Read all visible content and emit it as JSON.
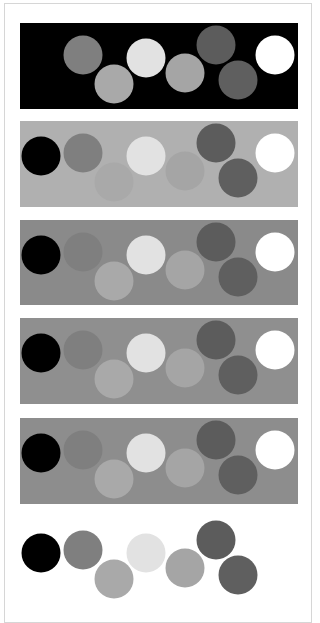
{
  "figure": {
    "circle_radius": 19.5,
    "circles": [
      {
        "id": "black",
        "color": "#000000",
        "cx": 21,
        "cy": 35
      },
      {
        "id": "mid-gray",
        "color": "#7f7f7f",
        "cx": 63,
        "cy": 32
      },
      {
        "id": "light-gray-a",
        "color": "#a9a9a9",
        "cx": 94,
        "cy": 61
      },
      {
        "id": "very-light",
        "color": "#e2e2e2",
        "cx": 126,
        "cy": 35
      },
      {
        "id": "light-gray-b",
        "color": "#a5a5a5",
        "cx": 165,
        "cy": 50
      },
      {
        "id": "dark-gray-a",
        "color": "#5c5c5c",
        "cx": 196,
        "cy": 22
      },
      {
        "id": "dark-gray-b",
        "color": "#5f5f5f",
        "cx": 218,
        "cy": 57
      },
      {
        "id": "white",
        "color": "#ffffff",
        "cx": 255,
        "cy": 32
      }
    ],
    "panels": [
      {
        "name": "panel-black-background",
        "top": 23,
        "height": 86,
        "background": "#000000"
      },
      {
        "name": "panel-light-gray-background",
        "top": 121,
        "height": 86,
        "background": "#b0b0b0"
      },
      {
        "name": "panel-mid-gray-background-1",
        "top": 220,
        "height": 85,
        "background": "#8a8a8a"
      },
      {
        "name": "panel-mid-gray-background-2",
        "top": 318,
        "height": 86,
        "background": "#8f8f8f"
      },
      {
        "name": "panel-mid-gray-background-3",
        "top": 418,
        "height": 86,
        "background": "#8d8d8d"
      },
      {
        "name": "panel-white-background",
        "top": 518,
        "height": 86,
        "background": "#ffffff"
      }
    ]
  }
}
